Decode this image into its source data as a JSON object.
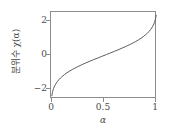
{
  "chart_data": {
    "type": "line",
    "title": "",
    "subtitle": "",
    "xlabel": "α",
    "ylabel": "분위수 χ(α)",
    "xlim": [
      0.0,
      1.0
    ],
    "ylim": [
      -2.6,
      2.6
    ],
    "xticks": [
      0,
      0.5,
      1
    ],
    "xtick_labels": [
      "0",
      "0.5",
      "1"
    ],
    "yticks": [
      2,
      0,
      -2
    ],
    "ytick_labels": [
      "2",
      "0",
      "−2"
    ],
    "grid": false,
    "legend": null,
    "annotations": [],
    "series": [
      {
        "name": "분위수 χ(α)",
        "color": "#5a5a5a",
        "linewidth": 1,
        "x": [
          0.008,
          0.01,
          0.013,
          0.016,
          0.02,
          0.025,
          0.03,
          0.04,
          0.05,
          0.06,
          0.075,
          0.09,
          0.11,
          0.13,
          0.15,
          0.175,
          0.2,
          0.225,
          0.25,
          0.275,
          0.3,
          0.325,
          0.35,
          0.375,
          0.4,
          0.425,
          0.45,
          0.475,
          0.5,
          0.525,
          0.55,
          0.575,
          0.6,
          0.625,
          0.65,
          0.675,
          0.7,
          0.725,
          0.75,
          0.775,
          0.8,
          0.825,
          0.85,
          0.87,
          0.89,
          0.91,
          0.925,
          0.94,
          0.95,
          0.96,
          0.97,
          0.975,
          0.98,
          0.984,
          0.987,
          0.99,
          0.992
        ],
        "y": [
          -2.409,
          -2.326,
          -2.226,
          -2.144,
          -2.054,
          -1.96,
          -1.881,
          -1.751,
          -1.645,
          -1.555,
          -1.44,
          -1.341,
          -1.227,
          -1.126,
          -1.036,
          -0.935,
          -0.842,
          -0.755,
          -0.674,
          -0.598,
          -0.524,
          -0.454,
          -0.385,
          -0.319,
          -0.253,
          -0.189,
          -0.126,
          -0.063,
          0.0,
          0.063,
          0.126,
          0.189,
          0.253,
          0.319,
          0.385,
          0.454,
          0.524,
          0.598,
          0.674,
          0.755,
          0.842,
          0.935,
          1.036,
          1.126,
          1.227,
          1.341,
          1.44,
          1.555,
          1.645,
          1.751,
          1.881,
          1.96,
          2.054,
          2.144,
          2.226,
          2.326,
          2.409
        ]
      }
    ]
  },
  "figure": {
    "background": "#ffffff",
    "axis_color": "#8c8c8c",
    "text_color": "#4a4a4a"
  }
}
